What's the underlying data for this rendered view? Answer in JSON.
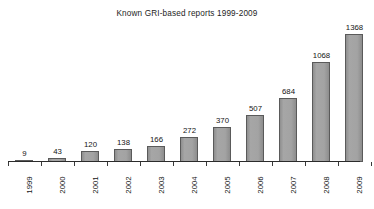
{
  "chart_data": {
    "type": "bar",
    "title": "Known GRI-based reports 1999-2009",
    "xlabel": "",
    "ylabel": "",
    "grid": false,
    "legend": "none",
    "axis": {
      "x_tick_rotation": -90,
      "y_axis_visible": false,
      "x_axis_visible": true,
      "value_labels_above_bars": true
    },
    "ylim": [
      0,
      1368
    ],
    "categories": [
      "1999",
      "2000",
      "2001",
      "2002",
      "2003",
      "2004",
      "2005",
      "2006",
      "2007",
      "2008",
      "2009"
    ],
    "values": [
      9,
      43,
      120,
      138,
      166,
      272,
      370,
      507,
      684,
      1068,
      1368
    ],
    "series": [
      {
        "name": "Known GRI-based reports",
        "values": [
          9,
          43,
          120,
          138,
          166,
          272,
          370,
          507,
          684,
          1068,
          1368
        ]
      }
    ],
    "colors": {
      "bar_fill": "#9a9a9a",
      "bar_border": "#5a5a5a",
      "axis": "#2b2b2b",
      "text": "#141414",
      "background": "#ffffff"
    }
  }
}
